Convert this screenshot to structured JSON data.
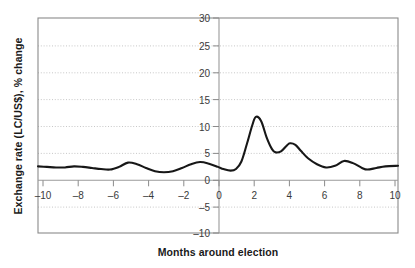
{
  "chart_data": {
    "type": "line",
    "title": "",
    "subtitle": "",
    "xlabel": "Months around election",
    "ylabel": "Exchange rate (LC/US$), % change",
    "xlim": [
      -10,
      10
    ],
    "ylim": [
      -10,
      30
    ],
    "xticks": [
      -10,
      -8,
      -6,
      -4,
      -2,
      0,
      2,
      4,
      6,
      8,
      10
    ],
    "xtick_labels": [
      "–10",
      "–8",
      "–6",
      "–4",
      "–2",
      "0",
      "2",
      "4",
      "6",
      "8",
      "10"
    ],
    "yticks": [
      -10,
      -5,
      0,
      5,
      10,
      15,
      20,
      25,
      30
    ],
    "ytick_labels": [
      "–10",
      "–5",
      "0",
      "5",
      "10",
      "15",
      "20",
      "25",
      "30"
    ],
    "grid": "horizontal-dotted",
    "legend": "none",
    "annotations": [],
    "series": [
      {
        "name": "Exchange rate (LC/US$), % change",
        "color": "#171717",
        "x": [
          -10.0,
          -9.5,
          -9.0,
          -8.5,
          -8.0,
          -7.5,
          -7.0,
          -6.5,
          -6.0,
          -5.5,
          -5.0,
          -4.5,
          -4.0,
          -3.5,
          -3.0,
          -2.5,
          -2.0,
          -1.5,
          -1.0,
          -0.5,
          0.0,
          0.3,
          0.7,
          1.0,
          1.3,
          1.6,
          1.9,
          2.1,
          2.4,
          2.7,
          3.0,
          3.2,
          3.5,
          3.8,
          4.0,
          4.3,
          4.6,
          5.0,
          5.5,
          6.0,
          6.5,
          7.0,
          7.5,
          8.0,
          8.3,
          8.8,
          9.3,
          10.0
        ],
        "y": [
          2.4,
          2.3,
          2.2,
          2.2,
          2.4,
          2.3,
          2.1,
          1.9,
          1.8,
          2.3,
          3.1,
          2.8,
          2.1,
          1.5,
          1.3,
          1.5,
          2.1,
          2.8,
          3.2,
          2.9,
          2.3,
          1.9,
          1.6,
          1.9,
          3.3,
          6.5,
          10.0,
          11.6,
          10.8,
          7.8,
          5.6,
          5.0,
          5.2,
          6.2,
          6.7,
          6.4,
          5.3,
          3.9,
          2.8,
          2.2,
          2.5,
          3.4,
          3.0,
          2.1,
          1.8,
          2.1,
          2.4,
          2.5
        ]
      }
    ],
    "peak_values": {
      "primary_peak_month": 2.1,
      "primary_peak_value": 11.6,
      "secondary_peak_month": 4.0,
      "secondary_peak_value": 6.7,
      "pre_election_min_month": 0.7,
      "pre_election_min_value": 1.6
    }
  }
}
